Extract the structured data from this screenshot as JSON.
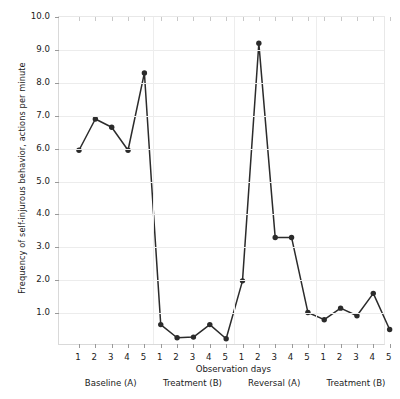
{
  "chart_data": {
    "type": "line",
    "title": "",
    "xlabel": "Observation days",
    "ylabel": "Frequency of self-injurous behavior, actions per minute",
    "ylim": [
      0,
      10
    ],
    "y_ticks": [
      "1.0",
      "2.0",
      "3.0",
      "4.0",
      "5.0",
      "6.0",
      "7.0",
      "8.0",
      "9.0",
      "10.0"
    ],
    "y_tick_values": [
      1,
      2,
      3,
      4,
      5,
      6,
      7,
      8,
      9,
      10
    ],
    "grid": "horizontal",
    "legend": "none",
    "marker": "filled-circle",
    "line_color": "#2b2b2b",
    "marker_color": "#2b2b2b",
    "grid_color": "#ececec",
    "x_tick_labels": [
      "1",
      "2",
      "3",
      "4",
      "5",
      "1",
      "2",
      "3",
      "4",
      "5",
      "1",
      "2",
      "3",
      "4",
      "5",
      "1",
      "2",
      "3",
      "4",
      "5"
    ],
    "phases": [
      {
        "name": "Baseline (A)",
        "days": [
          "1",
          "2",
          "3",
          "4",
          "5"
        ],
        "values": [
          5.95,
          6.9,
          6.65,
          5.95,
          8.3
        ]
      },
      {
        "name": "Treatment (B)",
        "days": [
          "1",
          "2",
          "3",
          "4",
          "5"
        ],
        "values": [
          0.65,
          0.25,
          0.27,
          0.65,
          0.22
        ]
      },
      {
        "name": "Reversal (A)",
        "days": [
          "1",
          "2",
          "3",
          "4",
          "5"
        ],
        "values": [
          1.98,
          9.2,
          3.3,
          3.3,
          1.02
        ]
      },
      {
        "name": "Treatment (B)",
        "days": [
          "1",
          "2",
          "3",
          "4",
          "5"
        ],
        "values": [
          0.8,
          1.15,
          0.92,
          1.6,
          0.5
        ]
      }
    ],
    "x": [
      1,
      2,
      3,
      4,
      5,
      6,
      7,
      8,
      9,
      10,
      11,
      12,
      13,
      14,
      15,
      16,
      17,
      18,
      19,
      20
    ],
    "values": [
      5.95,
      6.9,
      6.65,
      5.95,
      8.3,
      0.65,
      0.25,
      0.27,
      0.65,
      0.22,
      1.98,
      9.2,
      3.3,
      3.3,
      1.02,
      0.8,
      1.15,
      0.92,
      1.6,
      0.5
    ],
    "phase_dividers_after_index": [
      5,
      10,
      15
    ]
  }
}
